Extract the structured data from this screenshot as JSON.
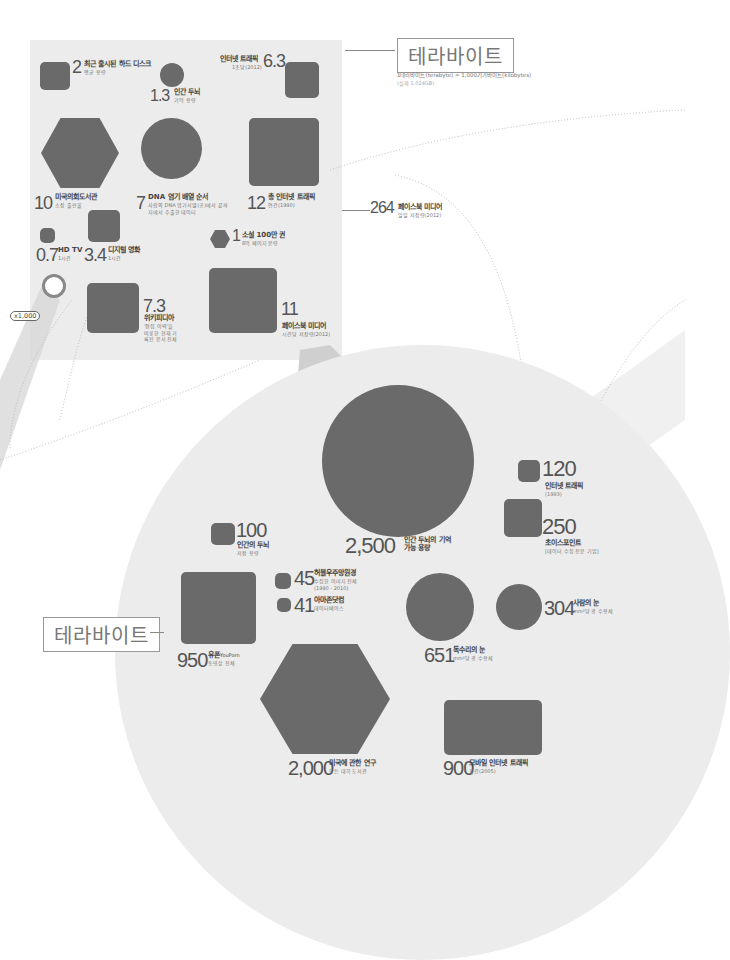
{
  "title": {
    "label": "테라바이트",
    "definition": "1테라바이트(terabyte) ≈ 1,000기가바이트(kilobytes)",
    "note": "(실제 1,024GB)"
  },
  "title_lower": {
    "label": "테라바이트"
  },
  "multiplier": "x1,000",
  "colors": {
    "shape": "#6a6a6a",
    "panel": "#ececec",
    "text": "#555555"
  },
  "small_panel": {
    "items": [
      {
        "value": "2",
        "label": "최근 출시된 하드 디스크",
        "sub": "평균 용량",
        "shape": "square"
      },
      {
        "value": "1.3",
        "label": "인간 두뇌",
        "sub": "기억 용량",
        "shape": "circle"
      },
      {
        "value": "6.3",
        "label": "인터넷 트래픽",
        "sub": "1초당(2012)",
        "shape": "square"
      },
      {
        "value": "10",
        "label": "미국의회도서관",
        "sub": "소장 출판물",
        "shape": "hexagon"
      },
      {
        "value": "7",
        "label": "DNA 염기 배열 순서",
        "sub": "사람의 DNA 염기서열(공)에서 끝까지에서 추출한 데이터",
        "shape": "circle"
      },
      {
        "value": "12",
        "label": "총 인터넷 트래픽",
        "sub": "연간(1990)",
        "shape": "square"
      },
      {
        "value": "0.7",
        "label": "HD TV",
        "sub": "1시간",
        "shape": "square"
      },
      {
        "value": "3.4",
        "label": "디지털 영화",
        "sub": "1시간",
        "shape": "square"
      },
      {
        "value": "1",
        "label": "소설 100만 권",
        "sub": "8억 페이지 분량",
        "shape": "hexagon"
      },
      {
        "value": "7.3",
        "label": "위키피디아",
        "sub": "'편집 이력'을 비롯한 현재 기록된 문서 전체",
        "shape": "square"
      },
      {
        "value": "11",
        "label": "페이스북 미디어",
        "sub": "시간당 저장량(2012)",
        "shape": "square"
      }
    ],
    "callout": {
      "value": "264",
      "label": "페이스북 미디어",
      "sub": "일일 저장량(2012)"
    }
  },
  "large_circle": {
    "items": [
      {
        "value": "2,500",
        "label": "인간 두뇌의 기억 가능 용량",
        "shape": "circle"
      },
      {
        "value": "120",
        "label": "인터넷 트래픽",
        "sub": "(1993)",
        "shape": "square"
      },
      {
        "value": "250",
        "label": "초이스포인트",
        "sub": "[데이터 수집 전문 기업]",
        "shape": "square"
      },
      {
        "value": "100",
        "label": "인간의 두뇌",
        "sub": "저장 용량",
        "shape": "square"
      },
      {
        "value": "45",
        "label": "허블우주망원경",
        "sub": "수집한 이미지 전체 (1990 - 2010)",
        "shape": "square"
      },
      {
        "value": "41",
        "label": "아마존닷컴",
        "sub": "데이터베이스",
        "shape": "square"
      },
      {
        "value": "950",
        "label": "유폰",
        "label_en": "YouPorn",
        "sub": "동영상 전체",
        "shape": "square"
      },
      {
        "value": "651",
        "label": "독수리의 눈",
        "sub": "mm²당 광 수용체",
        "shape": "circle"
      },
      {
        "value": "304",
        "label": "사람의 눈",
        "sub": "mm²당 광 수용체",
        "shape": "circle"
      },
      {
        "value": "2,000",
        "label": "미국에 관한 연구",
        "sub": "모든 대학 도서관",
        "shape": "hexagon"
      },
      {
        "value": "900",
        "label": "모바일 인터넷 트래픽",
        "sub": "월간(2005)",
        "shape": "square"
      }
    ]
  }
}
